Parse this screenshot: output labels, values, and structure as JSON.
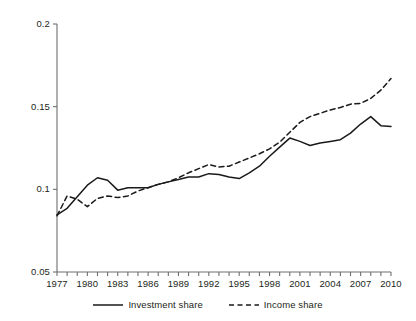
{
  "chart_data": {
    "type": "line",
    "title": "",
    "xlabel": "",
    "ylabel": "",
    "xlim": [
      1977,
      2010
    ],
    "ylim": [
      0.05,
      0.2
    ],
    "grid": false,
    "legend_position": "bottom-center",
    "y_ticks": [
      "0.05",
      "0.1",
      "0.15",
      "0.2"
    ],
    "y_tick_values": [
      0.05,
      0.1,
      0.15,
      0.2
    ],
    "x_ticks": [
      "1977",
      "1980",
      "1983",
      "1986",
      "1989",
      "1992",
      "1995",
      "1998",
      "2001",
      "2004",
      "2007",
      "2010"
    ],
    "x_tick_values": [
      1977,
      1980,
      1983,
      1986,
      1989,
      1992,
      1995,
      1998,
      2001,
      2004,
      2007,
      2010
    ],
    "x": [
      1977,
      1978,
      1979,
      1980,
      1981,
      1982,
      1983,
      1984,
      1985,
      1986,
      1987,
      1988,
      1989,
      1990,
      1991,
      1992,
      1993,
      1994,
      1995,
      1996,
      1997,
      1998,
      1999,
      2000,
      2001,
      2002,
      2003,
      2004,
      2005,
      2006,
      2007,
      2008,
      2009,
      2010
    ],
    "series": [
      {
        "name": "Investment share",
        "style": "solid",
        "color": "#1a1a1a",
        "values": [
          0.0845,
          0.0885,
          0.0955,
          0.1025,
          0.107,
          0.1055,
          0.0995,
          0.101,
          0.101,
          0.101,
          0.103,
          0.1045,
          0.106,
          0.1075,
          0.1075,
          0.1095,
          0.109,
          0.1075,
          0.1065,
          0.11,
          0.114,
          0.12,
          0.1255,
          0.131,
          0.129,
          0.1265,
          0.128,
          0.129,
          0.13,
          0.134,
          0.1395,
          0.144,
          0.1385,
          0.138
        ]
      },
      {
        "name": "Income share",
        "style": "dashed",
        "color": "#1a1a1a",
        "values": [
          0.084,
          0.096,
          0.094,
          0.0895,
          0.0945,
          0.096,
          0.095,
          0.096,
          0.099,
          0.101,
          0.103,
          0.1045,
          0.107,
          0.11,
          0.1125,
          0.115,
          0.1135,
          0.114,
          0.1165,
          0.119,
          0.1215,
          0.1245,
          0.1285,
          0.1345,
          0.1405,
          0.144,
          0.146,
          0.148,
          0.1495,
          0.1515,
          0.152,
          0.155,
          0.16,
          0.167
        ]
      }
    ]
  },
  "legend": {
    "entries": [
      {
        "label": "Investment share",
        "style": "solid"
      },
      {
        "label": "Income share",
        "style": "dashed"
      }
    ]
  }
}
